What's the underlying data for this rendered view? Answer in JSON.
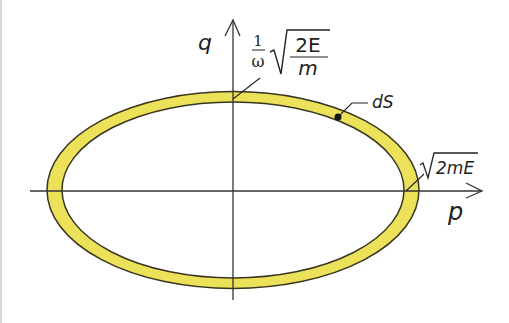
{
  "diagram": {
    "axes": {
      "vertical_label": "q",
      "horizontal_label": "p"
    },
    "annotations": {
      "q_intercept": {
        "fraction_num": "1",
        "fraction_den": "ω",
        "sqrt_num": "2E",
        "sqrt_den": "m"
      },
      "p_intercept": {
        "sqrt_arg": "2mE"
      },
      "area_element": "dS"
    },
    "colors": {
      "band_fill": "#ece25a",
      "band_stroke": "#3a3520",
      "axis": "#333333",
      "background": "#ffffff"
    }
  }
}
